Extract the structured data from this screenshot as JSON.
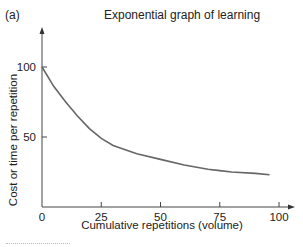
{
  "panel_label": "(a)",
  "chart_data": {
    "type": "line",
    "title": "Exponential graph of learning",
    "xlabel": "Cumulative repetitions (volume)",
    "ylabel": "Cost or time per repetition",
    "x_ticks": [
      0,
      25,
      50,
      75,
      100
    ],
    "y_ticks": [
      50,
      100
    ],
    "xlim": [
      0,
      100
    ],
    "ylim": [
      0,
      125
    ],
    "grid": false,
    "series": [
      {
        "name": "learning curve",
        "x": [
          0,
          5,
          10,
          15,
          20,
          25,
          30,
          40,
          50,
          60,
          70,
          75,
          80,
          90,
          96
        ],
        "y": [
          100,
          86,
          75,
          65,
          56,
          49,
          44,
          38,
          34,
          30,
          27,
          26,
          25,
          24,
          23
        ]
      }
    ],
    "color": "#666666"
  }
}
